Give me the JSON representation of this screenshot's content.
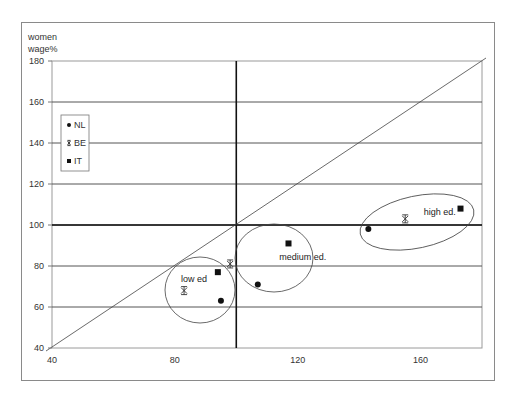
{
  "chart_data": {
    "type": "scatter",
    "title": "",
    "xlabel": "",
    "ylabel": "women wage%",
    "ylabel_lines": [
      "women",
      "wage%"
    ],
    "xlim": [
      40,
      180
    ],
    "ylim": [
      40,
      180
    ],
    "x_ticks": [
      40,
      80,
      120,
      160
    ],
    "y_ticks": [
      40,
      60,
      80,
      100,
      120,
      140,
      160,
      180
    ],
    "grid": "horizontal",
    "reference_lines": {
      "diagonal": "y = x",
      "vertical_at_x": 100,
      "horizontal_at_y": 100
    },
    "legend": {
      "position": "upper-left inside",
      "entries": [
        {
          "name": "NL",
          "marker": "diamond"
        },
        {
          "name": "BE",
          "marker": "star"
        },
        {
          "name": "IT",
          "marker": "square"
        }
      ]
    },
    "groups": [
      "low ed",
      "medium ed.",
      "high ed."
    ],
    "series": [
      {
        "name": "NL",
        "marker": "diamond",
        "points": [
          {
            "group": "low ed",
            "x": 95,
            "y": 63
          },
          {
            "group": "medium ed.",
            "x": 107,
            "y": 71
          },
          {
            "group": "high ed.",
            "x": 143,
            "y": 98
          }
        ]
      },
      {
        "name": "BE",
        "marker": "star",
        "points": [
          {
            "group": "low ed",
            "x": 83,
            "y": 68
          },
          {
            "group": "medium ed.",
            "x": 98,
            "y": 81
          },
          {
            "group": "high ed.",
            "x": 155,
            "y": 103
          }
        ]
      },
      {
        "name": "IT",
        "marker": "square",
        "points": [
          {
            "group": "low ed",
            "x": 94,
            "y": 77
          },
          {
            "group": "medium ed.",
            "x": 117,
            "y": 91
          },
          {
            "group": "high ed.",
            "x": 173,
            "y": 108
          }
        ]
      }
    ],
    "annotations": [
      {
        "text": "low ed",
        "x": 82,
        "y": 72
      },
      {
        "text": "medium ed.",
        "x": 114,
        "y": 83
      },
      {
        "text": "high ed.",
        "x": 161,
        "y": 105
      }
    ]
  }
}
